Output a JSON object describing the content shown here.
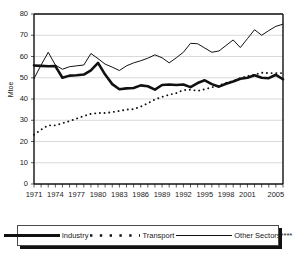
{
  "chart_data": {
    "type": "line",
    "title": "",
    "xlabel": "",
    "ylabel": "Mtoe",
    "ylim": [
      0,
      80
    ],
    "ytick_step": 10,
    "yticks": [
      0,
      10,
      20,
      30,
      40,
      50,
      60,
      70,
      80
    ],
    "xlim": [
      1971,
      2006
    ],
    "x": [
      1971,
      1972,
      1973,
      1974,
      1975,
      1976,
      1977,
      1978,
      1979,
      1980,
      1981,
      1982,
      1983,
      1984,
      1985,
      1986,
      1987,
      1988,
      1989,
      1990,
      1991,
      1992,
      1993,
      1994,
      1995,
      1996,
      1997,
      1998,
      1999,
      2000,
      2001,
      2002,
      2003,
      2004,
      2005,
      2006
    ],
    "xtick_labels": [
      "1971",
      "1974",
      "1977",
      "1980",
      "1983",
      "1986",
      "1989",
      "1992",
      "1995",
      "1998",
      "2001",
      "2005"
    ],
    "xtick_values": [
      1971,
      1974,
      1977,
      1980,
      1983,
      1986,
      1989,
      1992,
      1995,
      1998,
      2001,
      2005
    ],
    "grid": true,
    "grid_axis": "y",
    "legend_position": "bottom",
    "series": [
      {
        "name": "Industry",
        "style": "thick-solid",
        "color": "#111111",
        "values": [
          55.8,
          55.6,
          55.4,
          55.5,
          50.0,
          51.0,
          51.2,
          51.5,
          53.5,
          57.0,
          51.5,
          47.0,
          44.6,
          45.0,
          45.2,
          46.4,
          46.0,
          44.4,
          46.6,
          46.8,
          46.6,
          46.8,
          45.6,
          47.5,
          48.8,
          47.0,
          45.8,
          47.2,
          48.2,
          49.5,
          50.0,
          51.2,
          50.0,
          49.8,
          51.4,
          49.3
        ]
      },
      {
        "name": "Transport",
        "style": "dotted",
        "color": "#111111",
        "values": [
          23.2,
          25.6,
          27.6,
          27.6,
          28.6,
          29.6,
          30.8,
          32.0,
          33.0,
          33.4,
          33.4,
          33.8,
          34.4,
          35.0,
          35.2,
          36.4,
          38.0,
          39.8,
          41.0,
          42.0,
          42.8,
          44.2,
          44.4,
          43.8,
          44.6,
          45.5,
          46.4,
          47.6,
          48.4,
          49.8,
          50.8,
          51.4,
          52.4,
          52.2,
          52.2,
          52.2
        ]
      },
      {
        "name": "Other Sectors****",
        "style": "thin-solid",
        "color": "#111111",
        "values": [
          49.6,
          56.0,
          62.0,
          56.0,
          54.0,
          55.2,
          55.6,
          56.0,
          61.4,
          59.0,
          56.4,
          55.0,
          53.4,
          55.6,
          57.0,
          58.0,
          59.2,
          60.8,
          59.4,
          57.0,
          59.4,
          62.0,
          66.2,
          66.0,
          64.0,
          62.0,
          62.6,
          65.2,
          67.8,
          64.2,
          68.4,
          72.6,
          70.0,
          72.2,
          74.2,
          75.2
        ]
      }
    ]
  },
  "legend": {
    "items": [
      {
        "label": "Industry",
        "swatch": "thick-solid-line-swatch"
      },
      {
        "label": "Transport",
        "swatch": "dotted-line-swatch"
      },
      {
        "label": "Other Sectors****",
        "swatch": "thin-solid-line-swatch"
      }
    ]
  }
}
